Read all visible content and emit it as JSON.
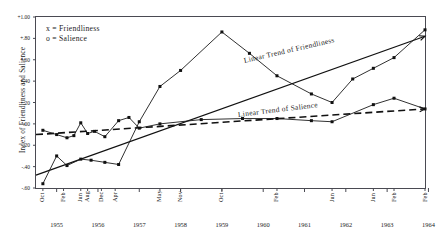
{
  "chart_data": {
    "type": "line",
    "title": "",
    "xlabel": "",
    "ylabel": "Index of Friendliness and Salience",
    "xlim": [
      0,
      113
    ],
    "ylim": [
      -0.6,
      1.0
    ],
    "grid": false,
    "legend_position": "top-left",
    "legend": [
      {
        "marker": "x",
        "label": "x = Friendliness"
      },
      {
        "marker": "o",
        "label": "o = Salience"
      }
    ],
    "annotations": [
      {
        "text": "Linear Trend of Friendliness",
        "rotation": -13
      },
      {
        "text": "Linear Trend of Salience",
        "rotation": -7
      }
    ],
    "y_ticks": [
      "+1.00",
      "+.80",
      "+.60",
      "+.40",
      "+.20",
      ".00",
      "-.20",
      "-.40",
      "-.60"
    ],
    "year_ticks": [
      "1955",
      "1956",
      "1957",
      "1958",
      "1959",
      "1960",
      "1961",
      "1962",
      "1963",
      "1964"
    ],
    "month_ticks": [
      {
        "label": "Oct",
        "x": 2
      },
      {
        "label": "Feb",
        "x": 8
      },
      {
        "label": "Jun",
        "x": 13
      },
      {
        "label": "Aug",
        "x": 15
      },
      {
        "label": "Dec",
        "x": 19
      },
      {
        "label": "Apr",
        "x": 23
      },
      {
        "label": "May",
        "x": 36
      },
      {
        "label": "Nov",
        "x": 42
      },
      {
        "label": "Oct",
        "x": 54
      },
      {
        "label": "Feb",
        "x": 70
      },
      {
        "label": "Jun",
        "x": 86
      },
      {
        "label": "Jun",
        "x": 98
      },
      {
        "label": "Feb",
        "x": 104
      },
      {
        "label": "Feb",
        "x": 113
      }
    ],
    "series": [
      {
        "name": "Friendliness",
        "marker": "x",
        "style": "solid",
        "points": [
          {
            "x": 2,
            "y": -0.56
          },
          {
            "x": 6,
            "y": -0.3
          },
          {
            "x": 9,
            "y": -0.39
          },
          {
            "x": 13,
            "y": -0.33
          },
          {
            "x": 16,
            "y": -0.34
          },
          {
            "x": 20,
            "y": -0.36
          },
          {
            "x": 24,
            "y": -0.38
          },
          {
            "x": 30,
            "y": 0.02
          },
          {
            "x": 36,
            "y": 0.35
          },
          {
            "x": 42,
            "y": 0.5
          },
          {
            "x": 54,
            "y": 0.86
          },
          {
            "x": 62,
            "y": 0.66
          },
          {
            "x": 70,
            "y": 0.45
          },
          {
            "x": 80,
            "y": 0.28
          },
          {
            "x": 86,
            "y": 0.2
          },
          {
            "x": 92,
            "y": 0.42
          },
          {
            "x": 98,
            "y": 0.52
          },
          {
            "x": 104,
            "y": 0.62
          },
          {
            "x": 113,
            "y": 0.88
          }
        ]
      },
      {
        "name": "Salience",
        "marker": "o",
        "style": "solid",
        "points": [
          {
            "x": 2,
            "y": -0.06
          },
          {
            "x": 6,
            "y": -0.1
          },
          {
            "x": 9,
            "y": -0.13
          },
          {
            "x": 11,
            "y": -0.11
          },
          {
            "x": 13,
            "y": 0.01
          },
          {
            "x": 15,
            "y": -0.09
          },
          {
            "x": 17,
            "y": -0.07
          },
          {
            "x": 20,
            "y": -0.12
          },
          {
            "x": 24,
            "y": 0.03
          },
          {
            "x": 27,
            "y": 0.06
          },
          {
            "x": 30,
            "y": -0.04
          },
          {
            "x": 36,
            "y": 0.0
          },
          {
            "x": 48,
            "y": 0.04
          },
          {
            "x": 60,
            "y": 0.05
          },
          {
            "x": 70,
            "y": 0.05
          },
          {
            "x": 80,
            "y": 0.03
          },
          {
            "x": 86,
            "y": 0.02
          },
          {
            "x": 98,
            "y": 0.18
          },
          {
            "x": 104,
            "y": 0.24
          },
          {
            "x": 113,
            "y": 0.14
          }
        ]
      }
    ],
    "trend_lines": [
      {
        "name": "Linear Trend of Friendliness",
        "style": "solid",
        "arrow": true,
        "start": {
          "x": 0,
          "y": -0.48
        },
        "end": {
          "x": 113,
          "y": 0.82
        }
      },
      {
        "name": "Linear Trend of Salience",
        "style": "dashed",
        "arrow": true,
        "start": {
          "x": 0,
          "y": -0.1
        },
        "end": {
          "x": 113,
          "y": 0.14
        }
      }
    ]
  }
}
